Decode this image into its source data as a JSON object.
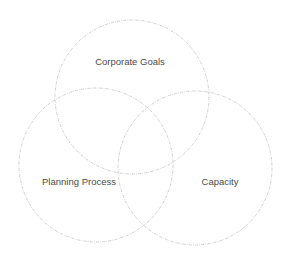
{
  "diagram": {
    "type": "venn",
    "stroke_color": "#c8c8c8",
    "text_color": "#4a4a4a",
    "sets": [
      {
        "id": "corporate-goals",
        "label": "Corporate Goals",
        "cx": 132,
        "cy": 97,
        "r": 77,
        "label_x": 130,
        "label_y": 62
      },
      {
        "id": "planning-process",
        "label": "Planning Process",
        "cx": 96,
        "cy": 165,
        "r": 77,
        "label_x": 79,
        "label_y": 182
      },
      {
        "id": "capacity",
        "label": "Capacity",
        "cx": 195,
        "cy": 168,
        "r": 77,
        "label_x": 220,
        "label_y": 182
      }
    ]
  }
}
